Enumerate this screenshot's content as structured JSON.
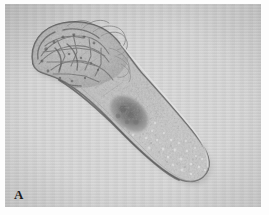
{
  "figure": {
    "panel_label": "A",
    "modality": "light-micrograph",
    "background_color": "#cfcfcf",
    "page_color": "#fdfdfd"
  },
  "specimen": {
    "name": "elongate-worm-like-organism",
    "orientation": "diagonal, anterior upper-left to posterior lower-right",
    "body_color": "#b9b9b9",
    "outline_color": "#6d6d6d",
    "regions": [
      {
        "id": "anterior-head",
        "label": "anterior end",
        "description": "broad rounded head bearing dense dark reticulate structures and fine curved filamentous projections extending to the upper right",
        "tone": "#a8a8a8"
      },
      {
        "id": "neck",
        "label": "neck region",
        "description": "narrowing transition between head and trunk with longitudinal striations",
        "tone": "#bcbcbc"
      },
      {
        "id": "mid-body-organ",
        "label": "dark internal mass",
        "description": "strongly pigmented granular organ at mid-body",
        "tone": "#6a6a6a"
      },
      {
        "id": "posterior-trunk",
        "label": "posterior trunk",
        "description": "tapering trunk filled with dense bright vesicular granules",
        "tone": "#b4b4b4"
      },
      {
        "id": "tail-tip",
        "label": "posterior tip",
        "description": "bluntly rounded terminal end",
        "tone": "#c0c0c0"
      }
    ]
  }
}
